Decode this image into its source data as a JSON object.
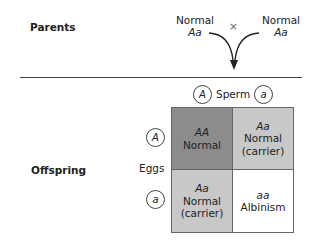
{
  "parents": {
    "label": "Parents",
    "left": {
      "phenotype": "Normal",
      "genotype": "Aa"
    },
    "right": {
      "phenotype": "Normal",
      "genotype": "Aa"
    },
    "cross_symbol": "×"
  },
  "offspring": {
    "label": "Offspring",
    "eggs_label": "Eggs",
    "sperm_label": "Sperm",
    "sperm_alleles": [
      "A",
      "a"
    ],
    "egg_alleles": [
      "A",
      "a"
    ],
    "cells": [
      {
        "genotype": "AA",
        "phenotype": "Normal",
        "note": "",
        "color": "#8c8c8c"
      },
      {
        "genotype": "Aa",
        "phenotype": "Normal",
        "note": "(carrier)",
        "color": "#c8c8c8"
      },
      {
        "genotype": "Aa",
        "phenotype": "Normal",
        "note": "(carrier)",
        "color": "#c8c8c8"
      },
      {
        "genotype": "aa",
        "phenotype": "Albinism",
        "note": "",
        "color": "#ffffff"
      }
    ]
  }
}
